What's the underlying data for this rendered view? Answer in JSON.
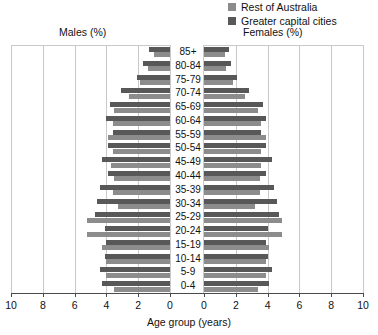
{
  "legend": {
    "items": [
      {
        "label": "Rest of Australia",
        "color": "#8c8c8c",
        "icon": "square-swatch-icon"
      },
      {
        "label": "Greater capital cities",
        "color": "#585858",
        "icon": "square-swatch-icon"
      }
    ]
  },
  "captions": {
    "left": "Males (%)",
    "right": "Females (%)"
  },
  "axis": {
    "title": "Age group (years)",
    "left_ticks": [
      "10",
      "8",
      "6",
      "4",
      "2",
      "0"
    ],
    "right_ticks": [
      "0",
      "2",
      "4",
      "6",
      "8",
      "10"
    ]
  },
  "chart_data": {
    "type": "bar",
    "title": "",
    "subtitle": "",
    "xlabel": "Age group (years)",
    "ylabel": "",
    "orientation": "horizontal",
    "layout": "population-pyramid",
    "grid": true,
    "legend_position": "top-right",
    "xlim": [
      0,
      10
    ],
    "xticks": [
      0,
      2,
      4,
      6,
      8,
      10
    ],
    "categories": [
      "85+",
      "80-84",
      "75-79",
      "70-74",
      "65-69",
      "60-64",
      "55-59",
      "50-54",
      "45-49",
      "40-44",
      "35-39",
      "30-34",
      "25-29",
      "20-24",
      "15-19",
      "10-14",
      "5-9",
      "0-4"
    ],
    "series": [
      {
        "name": "Males (%) - Greater capital cities",
        "side": "left",
        "color": "#585858",
        "values": [
          1.3,
          1.7,
          2.1,
          3.1,
          3.8,
          4.0,
          3.6,
          3.9,
          4.3,
          3.9,
          4.4,
          4.6,
          4.7,
          4.1,
          4.0,
          4.1,
          4.4,
          4.3
        ]
      },
      {
        "name": "Males (%) - Rest of Australia",
        "side": "left",
        "color": "#8c8c8c",
        "values": [
          1.0,
          1.4,
          1.9,
          2.6,
          3.5,
          3.6,
          3.9,
          3.6,
          3.7,
          3.5,
          3.6,
          3.3,
          5.2,
          5.2,
          4.3,
          4.0,
          4.0,
          3.5
        ]
      },
      {
        "name": "Females (%) - Greater capital cities",
        "side": "right",
        "color": "#585858",
        "values": [
          1.6,
          1.7,
          2.1,
          2.8,
          3.7,
          3.9,
          3.6,
          3.9,
          4.3,
          3.9,
          4.4,
          4.6,
          4.7,
          4.0,
          3.9,
          4.0,
          4.3,
          4.1
        ]
      },
      {
        "name": "Females (%) - Rest of Australia",
        "side": "right",
        "color": "#8c8c8c",
        "values": [
          1.3,
          1.4,
          1.8,
          2.6,
          3.4,
          3.6,
          3.9,
          3.6,
          3.6,
          3.5,
          3.5,
          3.2,
          4.9,
          4.9,
          4.1,
          3.9,
          3.9,
          3.4
        ]
      }
    ]
  }
}
